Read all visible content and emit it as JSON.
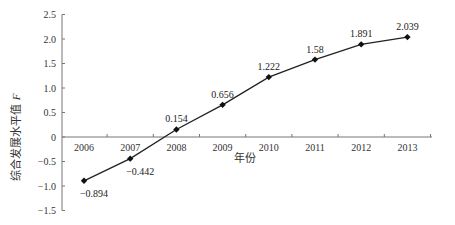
{
  "chart_data": {
    "type": "line",
    "title": "",
    "xlabel": "年份",
    "ylabel": "综合发展水平值 F",
    "categories": [
      "2006",
      "2007",
      "2008",
      "2009",
      "2010",
      "2011",
      "2012",
      "2013"
    ],
    "series": [
      {
        "name": "综合发展水平值 F",
        "values": [
          -0.894,
          -0.442,
          0.154,
          0.656,
          1.222,
          1.58,
          1.891,
          2.039
        ],
        "labels": [
          "-0.894",
          "-0.442",
          "0.154",
          "0.656",
          "1.222",
          "1.58",
          "1.891",
          "2.039"
        ]
      }
    ],
    "ylim": [
      -1.5,
      2.5
    ],
    "yticks": [
      "2.5",
      "2.0",
      "1.5",
      "1.0",
      "0.5",
      "0",
      "-0.5",
      "-1.0",
      "-1.5"
    ],
    "ytick_values": [
      2.5,
      2.0,
      1.5,
      1.0,
      0.5,
      0,
      -0.5,
      -1.0,
      -1.5
    ],
    "grid": false,
    "legend": "none",
    "colors": {
      "line": "#222222",
      "marker": "#111111",
      "axis": "#777777"
    }
  }
}
